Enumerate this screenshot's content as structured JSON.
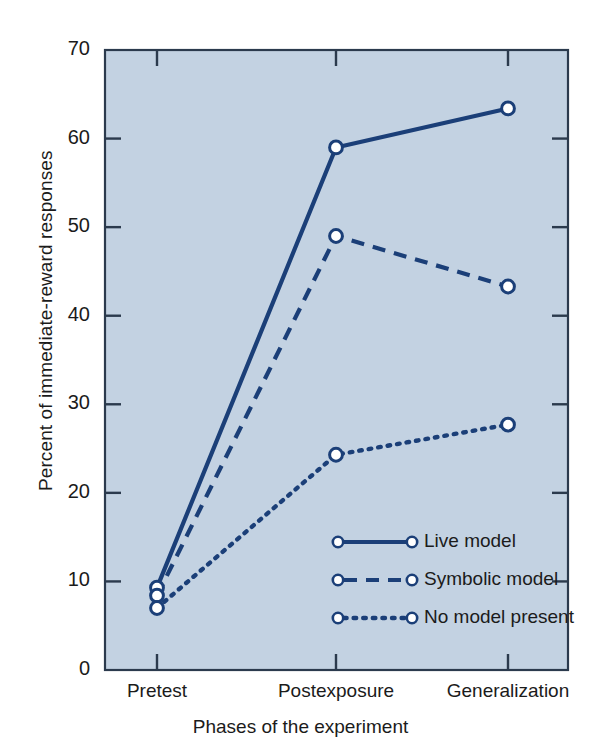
{
  "chart_data": {
    "type": "line",
    "title": "",
    "xlabel": "Phases of the experiment",
    "ylabel": "Percent of immediate-reward responses",
    "categories": [
      "Pretest",
      "Postexposure",
      "Generalization"
    ],
    "ylim": [
      0,
      70
    ],
    "yticks": [
      0,
      10,
      20,
      30,
      40,
      50,
      60,
      70
    ],
    "ytick_labels": [
      "0",
      "10",
      "20",
      "30",
      "40",
      "50",
      "60",
      "70"
    ],
    "grid": false,
    "legend_position": "inside-lower-right",
    "series": [
      {
        "name": "Live model",
        "style": "solid",
        "marker": "open-circle",
        "color": "#1b3f78",
        "values": [
          9.3,
          59.0,
          63.4
        ]
      },
      {
        "name": "Symbolic model",
        "style": "dashed",
        "marker": "open-circle",
        "color": "#1b3f78",
        "values": [
          8.4,
          49.0,
          43.3
        ]
      },
      {
        "name": "No model present",
        "style": "dotted",
        "marker": "open-circle",
        "color": "#1b3f78",
        "values": [
          7.0,
          24.3,
          27.7
        ]
      }
    ]
  },
  "figure": {
    "plot_background_color": "#c3d2e2",
    "line_color": "#1b3f78",
    "text_color": "#1b1b1b",
    "page_background_color": "#ffffff"
  },
  "legend": {
    "entries": [
      {
        "label": "Live model",
        "style": "solid"
      },
      {
        "label": "Symbolic model",
        "style": "dashed"
      },
      {
        "label": "No model present",
        "style": "dotted"
      }
    ]
  }
}
